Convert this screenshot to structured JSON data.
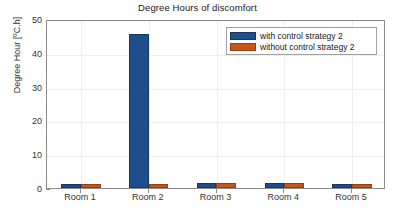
{
  "chart_data": {
    "type": "bar",
    "title": "Degree Hours of discomfort",
    "xlabel": "",
    "ylabel": "Degree Hour [ºC.h]",
    "categories": [
      "Room 1",
      "Room 2",
      "Room 3",
      "Room 4",
      "Room 5"
    ],
    "series": [
      {
        "name": "with control strategy 2",
        "color": "#1f4e8c",
        "values": [
          1.2,
          45.5,
          1.4,
          1.4,
          1.2
        ]
      },
      {
        "name": "without control strategy 2",
        "color": "#c8551b",
        "values": [
          1.2,
          1.1,
          1.4,
          1.4,
          1.2
        ]
      }
    ],
    "ylim": [
      0,
      50
    ],
    "yticks": [
      0,
      10,
      20,
      30,
      40,
      50
    ],
    "ytick_labels": [
      "0",
      "10",
      "20",
      "30",
      "40",
      "50"
    ],
    "grid": true,
    "legend_position": "top-right"
  },
  "legend": {
    "items": [
      {
        "label": "with control strategy 2"
      },
      {
        "label": "without control strategy 2"
      }
    ]
  }
}
